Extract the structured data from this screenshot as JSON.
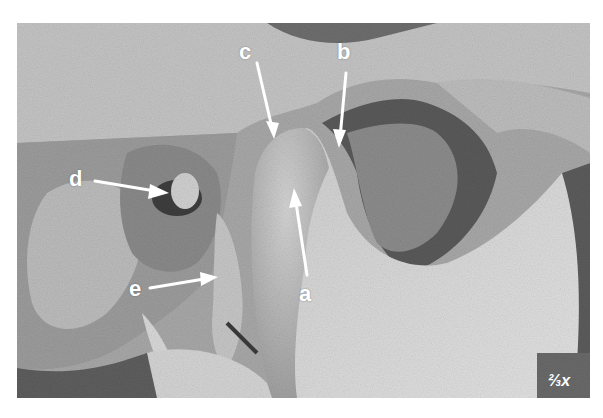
{
  "figure": {
    "labels": [
      {
        "id": "a",
        "text": "a"
      },
      {
        "id": "b",
        "text": "b"
      },
      {
        "id": "c",
        "text": "c"
      },
      {
        "id": "d",
        "text": "d"
      },
      {
        "id": "e",
        "text": "e"
      }
    ],
    "scale_text": "⅔x",
    "colors": {
      "background": "#ffffff",
      "label": "#ffffff",
      "photo_mid": "#8a8a8a",
      "photo_light": "#d8d8d8",
      "photo_dark": "#3a3a3a"
    }
  }
}
